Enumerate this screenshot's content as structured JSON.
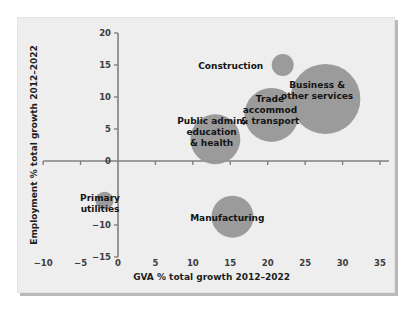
{
  "chart_data": {
    "type": "scatter",
    "title": "",
    "subtitle": "",
    "xlabel": "GVA % total growth 2012–2022",
    "ylabel": "Employment % total growth 2012–2022",
    "xlim": [
      -10,
      35
    ],
    "ylim": [
      -15,
      20
    ],
    "xticks": [
      "-10",
      "-5",
      "0",
      "5",
      "10",
      "15",
      "20",
      "25",
      "30",
      "35"
    ],
    "xtick_values": [
      -10,
      -5,
      0,
      5,
      10,
      15,
      20,
      25,
      30,
      35
    ],
    "yticks": [
      "20",
      "15",
      "10",
      "5",
      "0",
      "-10",
      "-15"
    ],
    "ytick_values": [
      20,
      15,
      10,
      5,
      0,
      -10,
      -15
    ],
    "grid": false,
    "legend": "none",
    "bubble_color": "#969696",
    "plot_background": "#eeeeee",
    "axis_color": "#808080",
    "points": [
      {
        "name": "Construction",
        "label": "Construction",
        "x": 22.0,
        "y": 15.0,
        "size": 11,
        "label_x": 19.4,
        "label_y": 14.8,
        "label_anchor": "end",
        "label_lines": [
          "Construction"
        ]
      },
      {
        "name": "Business & other services",
        "label": "Business & other services",
        "x": 27.7,
        "y": 9.7,
        "size": 35,
        "label_x": 26.6,
        "label_y": 11.0,
        "label_anchor": "middle",
        "label_lines": [
          "Business &",
          "other services"
        ]
      },
      {
        "name": "Trade, accommod & transport",
        "label": "Trade accommod & transport",
        "x": 20.5,
        "y": 7.2,
        "size": 27,
        "label_x": 20.3,
        "label_y": 8.0,
        "label_anchor": "middle",
        "label_lines": [
          "Trade",
          "accommod",
          "& transport"
        ]
      },
      {
        "name": "Public admin, education & health",
        "label": "Public admin, education & health",
        "x": 13.0,
        "y": 3.4,
        "size": 25,
        "label_x": 12.5,
        "label_y": 4.6,
        "label_anchor": "middle",
        "label_lines": [
          "Public admin,",
          "education",
          "& health"
        ]
      },
      {
        "name": "Manufacturing",
        "label": "Manufacturing",
        "x": 15.3,
        "y": -8.7,
        "size": 21,
        "label_x": 14.6,
        "label_y": -8.9,
        "label_anchor": "middle",
        "label_lines": [
          "Manufacturing"
        ]
      },
      {
        "name": "Primary utilities",
        "label": "Primary utilities",
        "x": -1.8,
        "y": -6.2,
        "size": 9,
        "label_x": -2.4,
        "label_y": -6.6,
        "label_anchor": "middle",
        "label_lines": [
          "Primary",
          "utilities"
        ]
      }
    ]
  }
}
